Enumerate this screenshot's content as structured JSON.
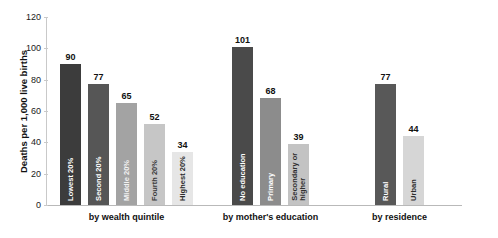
{
  "chart_data": {
    "type": "bar",
    "title": "",
    "subtitle": "",
    "xlabel": "",
    "ylabel": "Deaths per 1,000 live births",
    "ylim": [
      0,
      120
    ],
    "yticks": [
      0,
      20,
      40,
      60,
      80,
      100,
      120
    ],
    "ytick_labels": [
      "0",
      "20",
      "40",
      "60",
      "80",
      "100",
      "120"
    ],
    "grid": false,
    "legend": "none",
    "categories": [
      "Lowest 20%",
      "Second 20%",
      "Middle 20%",
      "Fourth 20%",
      "Highest 20%",
      "No education",
      "Primary",
      "Secondary or higher",
      "Rural",
      "Urban"
    ],
    "values": [
      90,
      77,
      65,
      52,
      34,
      101,
      68,
      39,
      77,
      44
    ],
    "groups": [
      {
        "caption": "by wealth quintile",
        "bars": [
          {
            "label": "Lowest 20%",
            "value": 90,
            "value_text": "90",
            "color": "#3c3c3c",
            "label_color": "#ffffff"
          },
          {
            "label": "Second 20%",
            "value": 77,
            "value_text": "77",
            "color": "#565656",
            "label_color": "#ffffff"
          },
          {
            "label": "Middle 20%",
            "value": 65,
            "value_text": "65",
            "color": "#a3a3a3",
            "label_color": "#f2f2f2"
          },
          {
            "label": "Fourth 20%",
            "value": 52,
            "value_text": "52",
            "color": "#c6c6c6",
            "label_color": "#3a3a3a"
          },
          {
            "label": "Highest 20%",
            "value": 34,
            "value_text": "34",
            "color": "#e6e6e6",
            "label_color": "#2b2b2b"
          }
        ]
      },
      {
        "caption": "by mother's education",
        "bars": [
          {
            "label": "No education",
            "value": 101,
            "value_text": "101",
            "color": "#4a4a4a",
            "label_color": "#ffffff"
          },
          {
            "label": "Primary",
            "value": 68,
            "value_text": "68",
            "color": "#8c8c8c",
            "label_color": "#ffffff"
          },
          {
            "label": "Secondary or higher",
            "value": 39,
            "value_text": "39",
            "color": "#c3c3c3",
            "label_color": "#2f2f2f"
          }
        ]
      },
      {
        "caption": "by residence",
        "bars": [
          {
            "label": "Rural",
            "value": 77,
            "value_text": "77",
            "color": "#585858",
            "label_color": "#ffffff"
          },
          {
            "label": "Urban",
            "value": 44,
            "value_text": "44",
            "color": "#d6d6d6",
            "label_color": "#2f2f2f"
          }
        ]
      }
    ]
  },
  "colors": {
    "axis": "#c9c9c9",
    "baseline": "#b9b9b9",
    "text": "#111111",
    "background": "#ffffff"
  }
}
